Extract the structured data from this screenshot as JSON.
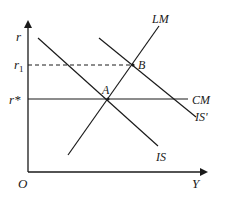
{
  "diagram": {
    "type": "IS-LM-CM economic diagram",
    "axes": {
      "y_label": "r",
      "x_label": "Y",
      "origin_label": "O"
    },
    "y_tick_labels": {
      "r1": "r",
      "r1_sub": "1",
      "r_star": "r*"
    },
    "curves": {
      "lm": "LM",
      "cm": "CM",
      "is": "IS",
      "is_prime": "IS'"
    },
    "points": {
      "a": "A",
      "b": "B"
    },
    "colors": {
      "line": "#1a1a1a",
      "background": "#ffffff"
    }
  }
}
